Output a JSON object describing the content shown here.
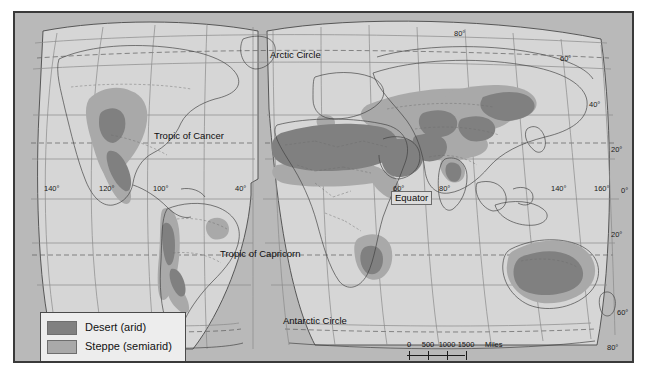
{
  "figure": {
    "type": "thematic-world-map",
    "projection": "interrupted-goode-homolosine",
    "background_color": "#b9b9b9",
    "land_color": "#d9d9d9",
    "frame_color": "#3a3a3a"
  },
  "legend": {
    "title": "",
    "items": [
      {
        "label": "Desert (arid)",
        "color": "#808080"
      },
      {
        "label": "Steppe (semiarid)",
        "color": "#a9a9a9"
      }
    ]
  },
  "scale_bar": {
    "miles": {
      "unit_label": "Miles",
      "ticks": [
        "0",
        "500",
        "1000",
        "1500"
      ]
    },
    "kilometers": {
      "unit_label": "Kilometers",
      "ticks": [
        "0",
        "1000",
        "2000"
      ]
    }
  },
  "reference_lines": [
    {
      "name": "arctic-circle",
      "label": "Arctic Circle"
    },
    {
      "name": "tropic-of-cancer",
      "label": "Tropic of Cancer"
    },
    {
      "name": "equator",
      "label": "Equator"
    },
    {
      "name": "tropic-of-capricorn",
      "label": "Tropic of Capricorn"
    },
    {
      "name": "antarctic-circle",
      "label": "Antarctic Circle"
    }
  ],
  "longitude_labels": [
    {
      "label": "140°",
      "x": 49,
      "y": 183
    },
    {
      "label": "120°",
      "x": 104,
      "y": 183
    },
    {
      "label": "100°",
      "x": 158,
      "y": 183
    },
    {
      "label": "40°",
      "x": 237,
      "y": 183
    },
    {
      "label": "60°",
      "x": 395,
      "y": 183
    },
    {
      "label": "80°",
      "x": 440,
      "y": 183
    },
    {
      "label": "140°",
      "x": 553,
      "y": 183
    },
    {
      "label": "160°",
      "x": 596,
      "y": 183
    }
  ],
  "latitude_labels": [
    {
      "label": "80°",
      "x": 455,
      "y": 27
    },
    {
      "label": "60°",
      "x": 561,
      "y": 52
    },
    {
      "label": "40°",
      "x": 590,
      "y": 98
    },
    {
      "label": "20°",
      "x": 612,
      "y": 143
    },
    {
      "label": "0°",
      "x": 622,
      "y": 184
    },
    {
      "label": "20°",
      "x": 612,
      "y": 228
    },
    {
      "label": "60°",
      "x": 618,
      "y": 306
    },
    {
      "label": "80°",
      "x": 608,
      "y": 341
    }
  ],
  "climate_regions": {
    "desert": [
      "Sahara",
      "Arabian Peninsula",
      "Iranian Plateau",
      "Thar",
      "Taklamakan",
      "Gobi",
      "Kalahari / Namib",
      "Atacama",
      "Patagonia",
      "Great Basin / Sonoran",
      "Australian Interior"
    ],
    "steppe": [
      "Sahel",
      "Eurasian Steppe",
      "Great Plains",
      "Mexican Plateau",
      "South African Veld",
      "Argentine Pampas margin",
      "Australian Rim"
    ]
  }
}
